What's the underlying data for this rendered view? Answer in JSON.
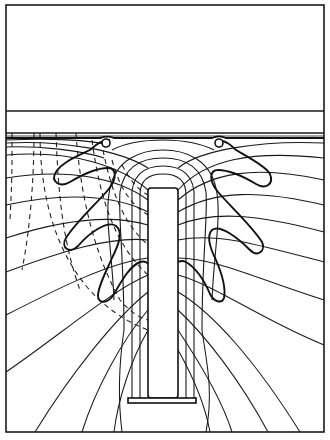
{
  "figure": {
    "type": "field-line diagram",
    "labels": [],
    "regions": {
      "top_box": {
        "x": 6,
        "y": 5,
        "w": 318,
        "h": 106
      },
      "layer_band": {
        "y_top": 111,
        "y_bottom": 133
      },
      "field_region": {
        "x": 6,
        "y": 133,
        "w": 318,
        "h": 299
      }
    },
    "electrode": {
      "x": 148,
      "y": 188,
      "w": 30,
      "h": 210
    },
    "base_plate": {
      "x": 128,
      "y": 398,
      "w": 68,
      "h": 5
    },
    "rings": [
      {
        "cx": 106,
        "cy": 143,
        "r": 4
      },
      {
        "cx": 219,
        "cy": 143,
        "r": 4
      }
    ],
    "colors": {
      "line": "#1a1a1a",
      "background": "#ffffff"
    }
  }
}
